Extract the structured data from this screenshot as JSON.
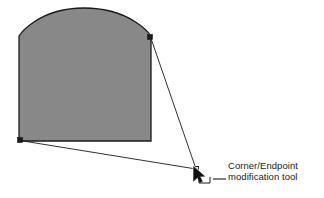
{
  "figure": {
    "background_color": "#ffffff",
    "stroke_color": "#1a1a1a",
    "shape": {
      "name": "arched-rectangle",
      "fill_color": "#888888",
      "stroke_color": "#1a1a1a",
      "stroke_width": 1.3,
      "left": 19,
      "right": 151,
      "bottom": 141,
      "shoulder_y": 36,
      "apex_x": 84,
      "apex_y": 8
    },
    "handles": [
      {
        "name": "top-right-corner-handle",
        "x": 150,
        "y": 37
      },
      {
        "name": "bottom-left-corner-handle",
        "x": 20,
        "y": 140
      }
    ],
    "leader_lines": [
      {
        "name": "leader-from-top-right",
        "x1": 150.5,
        "y1": 37,
        "x2": 196,
        "y2": 169
      },
      {
        "name": "leader-from-bottom-left",
        "x1": 20,
        "y1": 140.5,
        "x2": 196,
        "y2": 169
      }
    ],
    "target_marker": {
      "name": "endpoint-target-square",
      "x": 196,
      "y": 169,
      "size": 5,
      "fill_color": "#d8d8d8",
      "stroke_color": "#1a1a1a"
    },
    "cursor": {
      "name": "arrow-pointer-cursor",
      "tip_x": 194,
      "tip_y": 168,
      "fill_color": "#111111",
      "outline_color": "#ffffff"
    },
    "bracket": {
      "name": "corner-bracket-glyph",
      "x": 199,
      "y": 175,
      "width": 11,
      "height": 8,
      "stroke_color": "#1a1a1a"
    },
    "connector_dash": {
      "name": "label-connector-dash",
      "x1": 213,
      "y1": 179,
      "x2": 226,
      "y2": 179,
      "stroke_color": "#1a1a1a"
    }
  },
  "label": {
    "name": "callout-text",
    "line1": "Corner/Endpoint",
    "line2": "modification tool",
    "color": "#1a1a1a"
  }
}
